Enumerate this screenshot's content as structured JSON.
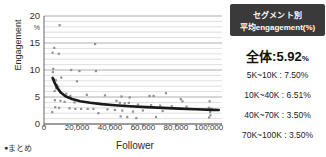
{
  "chart_data": {
    "type": "scatter",
    "title": "",
    "xlabel": "Follower",
    "ylabel": "Engagement",
    "y_unit": "%",
    "xlim": [
      0,
      108000
    ],
    "ylim": [
      0,
      20
    ],
    "xticks": [
      0,
      20000,
      40000,
      60000,
      80000,
      100000
    ],
    "xticklabels": [
      "0",
      "20,000",
      "40,000",
      "60,000",
      "80,000",
      "100,000"
    ],
    "yticks": [
      0,
      5,
      10,
      15,
      20
    ],
    "yticklabels": [
      "0",
      "5",
      "10",
      "15",
      "20"
    ],
    "grid": "horizontal-major-and-minor",
    "legend": "none",
    "points": [
      {
        "x": 9500,
        "y": 18.3
      },
      {
        "x": 6200,
        "y": 14.1
      },
      {
        "x": 5200,
        "y": 13.2
      },
      {
        "x": 9000,
        "y": 13.0
      },
      {
        "x": 31000,
        "y": 14.8
      },
      {
        "x": 5600,
        "y": 10.2
      },
      {
        "x": 5400,
        "y": 9.6
      },
      {
        "x": 16500,
        "y": 10.0
      },
      {
        "x": 21500,
        "y": 9.8
      },
      {
        "x": 31500,
        "y": 9.8
      },
      {
        "x": 10500,
        "y": 8.6
      },
      {
        "x": 6000,
        "y": 8.3
      },
      {
        "x": 7200,
        "y": 8.1
      },
      {
        "x": 20000,
        "y": 7.9
      },
      {
        "x": 7800,
        "y": 7.2
      },
      {
        "x": 8600,
        "y": 6.9
      },
      {
        "x": 7400,
        "y": 6.6
      },
      {
        "x": 6400,
        "y": 6.1
      },
      {
        "x": 9800,
        "y": 5.9
      },
      {
        "x": 13500,
        "y": 5.6
      },
      {
        "x": 16000,
        "y": 5.2
      },
      {
        "x": 26000,
        "y": 5.4
      },
      {
        "x": 37000,
        "y": 5.3
      },
      {
        "x": 47000,
        "y": 5.1
      },
      {
        "x": 52000,
        "y": 4.9
      },
      {
        "x": 64000,
        "y": 5.2
      },
      {
        "x": 66500,
        "y": 5.2
      },
      {
        "x": 74000,
        "y": 5.7
      },
      {
        "x": 83000,
        "y": 4.6
      },
      {
        "x": 84000,
        "y": 4.2
      },
      {
        "x": 100500,
        "y": 4.2
      },
      {
        "x": 6600,
        "y": 4.4
      },
      {
        "x": 10000,
        "y": 4.3
      },
      {
        "x": 12500,
        "y": 4.1
      },
      {
        "x": 18500,
        "y": 4.0
      },
      {
        "x": 44000,
        "y": 4.3
      },
      {
        "x": 46000,
        "y": 3.9
      },
      {
        "x": 49000,
        "y": 3.8
      },
      {
        "x": 51500,
        "y": 3.9
      },
      {
        "x": 57000,
        "y": 3.6
      },
      {
        "x": 65000,
        "y": 3.5
      },
      {
        "x": 70500,
        "y": 3.4
      },
      {
        "x": 77500,
        "y": 3.3
      },
      {
        "x": 86500,
        "y": 3.2
      },
      {
        "x": 100000,
        "y": 3.0
      },
      {
        "x": 101500,
        "y": 2.8
      },
      {
        "x": 6800,
        "y": 3.1
      },
      {
        "x": 9200,
        "y": 3.0
      },
      {
        "x": 15500,
        "y": 2.9
      },
      {
        "x": 19000,
        "y": 2.8
      },
      {
        "x": 22500,
        "y": 2.8
      },
      {
        "x": 26500,
        "y": 2.8
      },
      {
        "x": 30000,
        "y": 2.8
      },
      {
        "x": 38500,
        "y": 2.7
      },
      {
        "x": 43000,
        "y": 2.6
      },
      {
        "x": 47500,
        "y": 2.5
      },
      {
        "x": 54000,
        "y": 2.3
      },
      {
        "x": 60000,
        "y": 2.5
      },
      {
        "x": 72000,
        "y": 2.4
      },
      {
        "x": 100800,
        "y": 2.2
      },
      {
        "x": 5000,
        "y": 2.2
      },
      {
        "x": 33000,
        "y": 2.0
      },
      {
        "x": 46500,
        "y": 1.4
      },
      {
        "x": 50500,
        "y": 1.3
      },
      {
        "x": 56000,
        "y": 1.1
      },
      {
        "x": 68000,
        "y": 1.3
      },
      {
        "x": 100200,
        "y": 1.2
      },
      {
        "x": 101000,
        "y": 1.6
      }
    ],
    "trendline": {
      "label": "power-fit",
      "color": "#1a1a1a",
      "points": [
        {
          "x": 5200,
          "y": 8.55
        },
        {
          "x": 6500,
          "y": 7.6
        },
        {
          "x": 8000,
          "y": 6.7
        },
        {
          "x": 10000,
          "y": 5.9
        },
        {
          "x": 13000,
          "y": 5.15
        },
        {
          "x": 17000,
          "y": 4.62
        },
        {
          "x": 22000,
          "y": 4.22
        },
        {
          "x": 28000,
          "y": 3.92
        },
        {
          "x": 35000,
          "y": 3.68
        },
        {
          "x": 43000,
          "y": 3.48
        },
        {
          "x": 52000,
          "y": 3.3
        },
        {
          "x": 62000,
          "y": 3.13
        },
        {
          "x": 72000,
          "y": 2.98
        },
        {
          "x": 82000,
          "y": 2.84
        },
        {
          "x": 92000,
          "y": 2.72
        },
        {
          "x": 102000,
          "y": 2.62
        },
        {
          "x": 106000,
          "y": 2.58
        }
      ]
    }
  },
  "panel": {
    "header_line1": "セグメント別",
    "header_line2": "平均engagement(%)",
    "total_label": "全体:",
    "total_value": "5.92",
    "total_unit": "%",
    "segments": [
      {
        "label": "5K~10K : 7.50%"
      },
      {
        "label": "10K~40K : 6.51%"
      },
      {
        "label": "40K~70K : 3.50%"
      },
      {
        "label": "70K~100K : 3.50%"
      }
    ]
  },
  "footnote": {
    "bullet": "●",
    "text": "まとめ"
  }
}
